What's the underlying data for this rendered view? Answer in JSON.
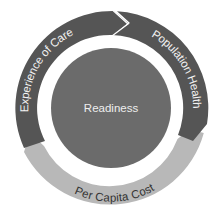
{
  "diagram": {
    "center": {
      "label": "Readiness"
    },
    "segments": [
      {
        "label": "Experience of Care",
        "color": "#555555",
        "text_color": "#f2f2f2"
      },
      {
        "label": "Population Health",
        "color": "#555555",
        "text_color": "#f2f2f2"
      },
      {
        "label": "Per Capita Cost",
        "color": "#b8b8b8",
        "text_color": "#333333"
      }
    ],
    "colors": {
      "center_fill": "#6b6b6b",
      "center_text": "#eeeeee",
      "background": "#ffffff"
    }
  }
}
